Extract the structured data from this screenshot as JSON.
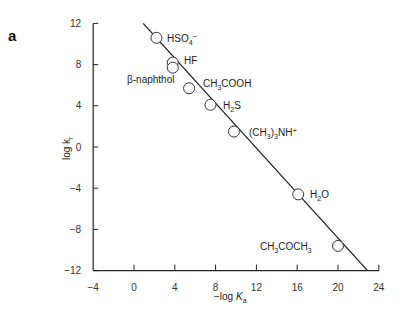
{
  "panel_label": "a",
  "chart_data": {
    "type": "scatter",
    "title": "",
    "xlabel": "-log Ka",
    "ylabel": "log kr",
    "xlim": [
      -4,
      24
    ],
    "ylim": [
      -12,
      12
    ],
    "xticks": [
      -4,
      0,
      4,
      8,
      12,
      16,
      20,
      24
    ],
    "yticks": [
      12,
      8,
      4,
      0,
      -4,
      -8,
      -12
    ],
    "grid": false,
    "legend": null,
    "points": [
      {
        "label": "HSO4-",
        "x": 2.2,
        "y": 10.6
      },
      {
        "label": "HF",
        "x": 3.8,
        "y": 8.2
      },
      {
        "label": "β-naphthol",
        "x": 3.8,
        "y": 7.7
      },
      {
        "label": "CH3COOH",
        "x": 5.4,
        "y": 5.7
      },
      {
        "label": "H2S",
        "x": 7.5,
        "y": 4.1
      },
      {
        "label": "(CH3)3NH+",
        "x": 9.8,
        "y": 1.5
      },
      {
        "label": "H2O",
        "x": 16.1,
        "y": -4.6
      },
      {
        "label": "CH3COCH3",
        "x": 20.0,
        "y": -9.6
      }
    ],
    "fit_line": {
      "x": [
        0.9,
        22.9
      ],
      "y": [
        12.0,
        -12.0
      ]
    }
  }
}
